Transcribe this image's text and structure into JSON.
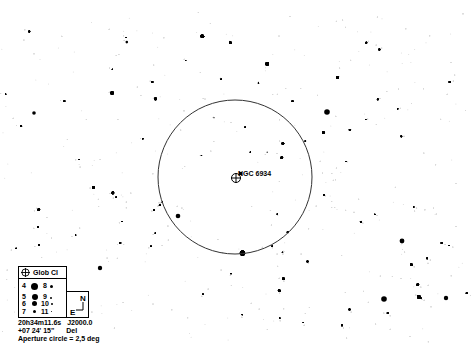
{
  "map": {
    "target": {
      "name": "NGC 6934",
      "type": "Glob Cl",
      "x": 236,
      "y": 178
    },
    "aperture_circle": {
      "cx": 235,
      "cy": 177,
      "r": 77,
      "label": "Aperture circle = 2,5 deg"
    },
    "coordinates": {
      "ra": "20h34m11.6s",
      "dec": "+07 24' 15\"",
      "epoch": "J2000.0",
      "constellation": "Del"
    },
    "orientation": {
      "north": "N",
      "east": "E"
    },
    "legend": {
      "object_type_label": "Glob Cl",
      "magnitudes": [
        {
          "mag": "4",
          "size": 4.2
        },
        {
          "mag": "5",
          "size": 3.4
        },
        {
          "mag": "6",
          "size": 2.8
        },
        {
          "mag": "7",
          "size": 2.2
        },
        {
          "mag": "8",
          "size": 1.7
        },
        {
          "mag": "9",
          "size": 1.3
        },
        {
          "mag": "10",
          "size": 1.0
        },
        {
          "mag": "11",
          "size": 0.8
        }
      ]
    },
    "colors": {
      "background": "#ffffff",
      "stars": "#000000",
      "circle": "#333333"
    }
  }
}
